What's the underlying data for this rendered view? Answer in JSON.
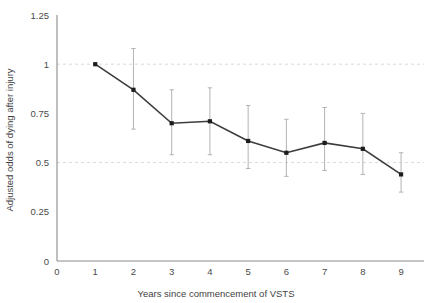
{
  "chart_data": {
    "type": "line",
    "title": "",
    "subtitle": "",
    "xlabel": "Years since commencement of VSTS",
    "ylabel": "Adjusted odds of dying after injury",
    "x": [
      1,
      2,
      3,
      4,
      5,
      6,
      7,
      8,
      9
    ],
    "values": [
      1.0,
      0.87,
      0.7,
      0.71,
      0.61,
      0.55,
      0.6,
      0.57,
      0.44
    ],
    "error_low": [
      1.0,
      0.67,
      0.54,
      0.54,
      0.47,
      0.43,
      0.46,
      0.44,
      0.35
    ],
    "error_high": [
      1.0,
      1.08,
      0.87,
      0.88,
      0.79,
      0.72,
      0.78,
      0.75,
      0.55
    ],
    "series": [
      {
        "name": "Adjusted odds of dying after injury",
        "values": [
          1.0,
          0.87,
          0.7,
          0.71,
          0.61,
          0.55,
          0.6,
          0.57,
          0.44
        ]
      }
    ],
    "xlim": [
      0,
      9.6
    ],
    "ylim": [
      0,
      1.25
    ],
    "xticks": [
      0,
      1,
      2,
      3,
      4,
      5,
      6,
      7,
      8,
      9
    ],
    "xtick_labels": [
      "0",
      "1",
      "2",
      "3",
      "4",
      "5",
      "6",
      "7",
      "8",
      "9"
    ],
    "yticks": [
      0,
      0.25,
      0.5,
      0.75,
      1,
      1.25
    ],
    "ytick_labels": [
      "0",
      "0.25",
      "0.5",
      "0.75",
      "1",
      "1.25"
    ],
    "gridlines": {
      "horizontal_dashed_at": [
        0.5,
        1
      ],
      "grid": "dashed-reference-lines"
    },
    "legend": {
      "visible": false,
      "position": "none"
    },
    "colors": {
      "line": "#3d3d3d",
      "marker": "#1c1c1c",
      "error_bar": "#b3b3b3",
      "gridline": "#d9d9d9",
      "axis": "#8b8b8b",
      "text": "#3f3f3f",
      "background": "#ffffff"
    },
    "reference_line_note": "Dashed horizontal reference lines at odds = 1 and odds = 0.5"
  }
}
